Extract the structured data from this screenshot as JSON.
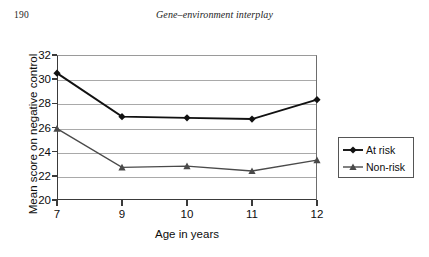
{
  "header": {
    "page_number": "190",
    "running_title": "Gene–environment interplay"
  },
  "chart_data": {
    "type": "line",
    "title": "",
    "xlabel": "Age in years",
    "ylabel": "Mean score on negative control",
    "categories": [
      "7",
      "9",
      "10",
      "11",
      "12"
    ],
    "x_tick_labels": [
      "7",
      "9",
      "10",
      "11",
      "12"
    ],
    "y_tick_labels": [
      "20",
      "22",
      "24",
      "26",
      "28",
      "30",
      "32"
    ],
    "y_ticks": [
      20,
      22,
      24,
      26,
      28,
      30,
      32
    ],
    "ylim": [
      20,
      32
    ],
    "grid": "horizontal",
    "legend_position": "right",
    "series": [
      {
        "name": "At risk",
        "marker": "diamond",
        "color": "#111111",
        "values": [
          30.5,
          26.9,
          26.8,
          26.7,
          28.3
        ]
      },
      {
        "name": "Non-risk",
        "marker": "triangle",
        "color": "#4a4a4a",
        "values": [
          25.9,
          22.7,
          22.8,
          22.4,
          23.3
        ]
      }
    ]
  },
  "legend": {
    "entries": [
      {
        "label": "At risk"
      },
      {
        "label": "Non-risk"
      }
    ]
  },
  "colors": {
    "at_risk": "#111111",
    "non_risk": "#4a4a4a",
    "gridline": "#a9a9a9",
    "axis": "#3a3a3a",
    "text": "#0d0d0d"
  }
}
